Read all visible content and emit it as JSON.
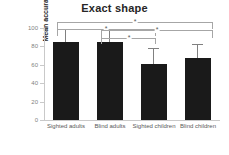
{
  "chart_data": {
    "type": "bar",
    "title": "Exact shape",
    "xlabel": "",
    "ylabel": "Mean accuracy (%)",
    "categories": [
      "Sighted adults",
      "Blind adults",
      "Sighted children",
      "Blind children"
    ],
    "values": [
      85,
      85,
      61,
      67
    ],
    "errors": [
      13,
      13,
      16,
      15
    ],
    "ylim": [
      0,
      100
    ],
    "yticks": [
      0,
      20,
      40,
      60,
      80,
      100
    ],
    "ytick_labels": [
      "0",
      "20",
      "40",
      "60",
      "80",
      "100"
    ],
    "grid": false,
    "legend": "none",
    "bar_color": "#1a1a1a",
    "error_color": "#808080",
    "axis_color": "#c9c9c9",
    "annotations": [
      {
        "label": "*",
        "from": "Sighted adults",
        "to": "Blind children"
      },
      {
        "label": "*",
        "from": "Sighted adults",
        "to": "Sighted children"
      },
      {
        "label": "*",
        "from": "Blind adults",
        "to": "Blind children"
      },
      {
        "label": "*",
        "from": "Blind adults",
        "to": "Sighted children"
      }
    ]
  }
}
